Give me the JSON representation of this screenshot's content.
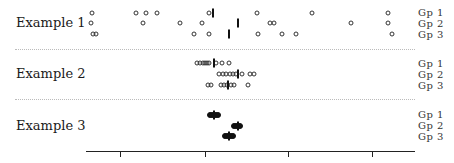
{
  "chart_data": {
    "type": "scatter",
    "title": "",
    "xlabel": "",
    "ylabel": "",
    "grid": false,
    "legend_position": "right (group labels per row)",
    "x_axis": {
      "pixel_range": [
        86,
        415
      ],
      "tick_pixels": [
        120,
        205,
        288,
        372
      ],
      "tick_labels": [
        "",
        "",
        "",
        ""
      ]
    },
    "panels": [
      {
        "name": "Example 1",
        "groups": [
          {
            "name": "Gp 1",
            "row_y": 13,
            "points_px": [
              92,
              136,
              146,
              157,
              209,
              257,
              312,
              388
            ],
            "median_px": 213
          },
          {
            "name": "Gp 2",
            "row_y": 23,
            "points_px": [
              91,
              143,
              180,
              202,
              270,
              274,
              351,
              388
            ],
            "median_px": 238
          },
          {
            "name": "Gp 3",
            "row_y": 34,
            "points_px": [
              93,
              96,
              194,
              209,
              258,
              282,
              296,
              392
            ],
            "median_px": 229
          }
        ]
      },
      {
        "name": "Example 2",
        "groups": [
          {
            "name": "Gp 1",
            "row_y": 63,
            "points_px": [
              197,
              200,
              203,
              205,
              207,
              209,
              216,
              222,
              229
            ],
            "median_px": 214
          },
          {
            "name": "Gp 2",
            "row_y": 74,
            "points_px": [
              219,
              223,
              226,
              230,
              233,
              236,
              242,
              250,
              254
            ],
            "median_px": 238
          },
          {
            "name": "Gp 3",
            "row_y": 85,
            "points_px": [
              208,
              211,
              221,
              224,
              227,
              231,
              234,
              248
            ],
            "median_px": 228
          }
        ]
      },
      {
        "name": "Example 3",
        "groups": [
          {
            "name": "Gp 1",
            "row_y": 115,
            "points_px": [
              210,
              212,
              214,
              216,
              218
            ],
            "median_px": 214
          },
          {
            "name": "Gp 2",
            "row_y": 126,
            "points_px": [
              234,
              236,
              238,
              240
            ],
            "median_px": 238
          },
          {
            "name": "Gp 3",
            "row_y": 136,
            "points_px": [
              225,
              227,
              229,
              231,
              233
            ],
            "median_px": 229
          }
        ]
      }
    ]
  },
  "labels": {
    "example1": "Example 1",
    "example2": "Example 2",
    "example3": "Example 3",
    "gp1": "Gp 1",
    "gp2": "Gp 2",
    "gp3": "Gp 3"
  }
}
